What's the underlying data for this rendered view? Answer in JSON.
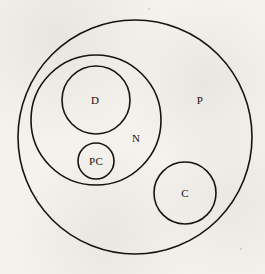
{
  "figure": {
    "type": "euler-diagram",
    "background_color": "#f3f1ec",
    "stroke_color": "#161412",
    "width": 265,
    "height": 274
  },
  "sets": [
    {
      "id": "P",
      "label": "P",
      "cx": 135,
      "cy": 137,
      "r": 117,
      "label_x": 200,
      "label_y": 100,
      "contains": [
        "N",
        "C"
      ]
    },
    {
      "id": "N",
      "label": "N",
      "cx": 96,
      "cy": 120,
      "r": 65,
      "label_x": 136,
      "label_y": 138,
      "contains": [
        "D",
        "PC"
      ]
    },
    {
      "id": "D",
      "label": "D",
      "cx": 96,
      "cy": 100,
      "r": 34,
      "label_x": 95,
      "label_y": 100,
      "contains": []
    },
    {
      "id": "PC",
      "label": "PC",
      "cx": 96,
      "cy": 161,
      "r": 18,
      "label_x": 96,
      "label_y": 161,
      "contains": []
    },
    {
      "id": "C",
      "label": "C",
      "cx": 185,
      "cy": 193,
      "r": 31,
      "label_x": 185,
      "label_y": 193,
      "contains": []
    }
  ]
}
